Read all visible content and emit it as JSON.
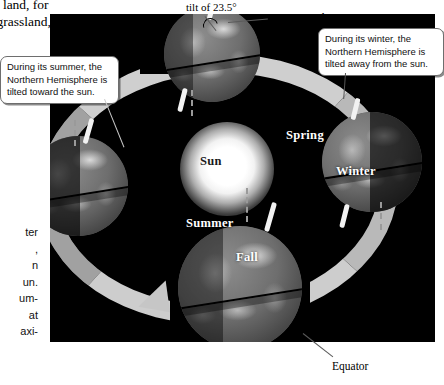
{
  "page": {
    "figure_type": "earth-seasons-orbit-diagram"
  },
  "body_text": {
    "top_lines": [
      "on land, for",
      "t, grassland,"
    ],
    "left_lines": [
      "ter",
      ",",
      "n",
      "un.",
      "um-",
      "at",
      "axi-"
    ]
  },
  "annotations": {
    "tilt": "tilt of 23.5°",
    "axis_lines": [
      "Axis around",
      "which Earth",
      "rotates"
    ],
    "equator": "Equator"
  },
  "callouts": {
    "summer": "During its summer, the Northern Hemisphere is tilted toward the sun.",
    "winter": "During its winter, the Northern Hemisphere is tilted away from the sun."
  },
  "sun": {
    "label": "Sun"
  },
  "seasons": [
    {
      "label": "Spring"
    },
    {
      "label": "Winter"
    },
    {
      "label": "Summer"
    },
    {
      "label": "Fall"
    }
  ],
  "colors": {
    "panel_background": "#000000",
    "orbit_ring": "#b9b9b9",
    "sun_core": "#ffffff",
    "globe_base": "#6e6e6e",
    "axis_rod": "#f2f2f2",
    "callout_border": "#6e6e6e"
  }
}
